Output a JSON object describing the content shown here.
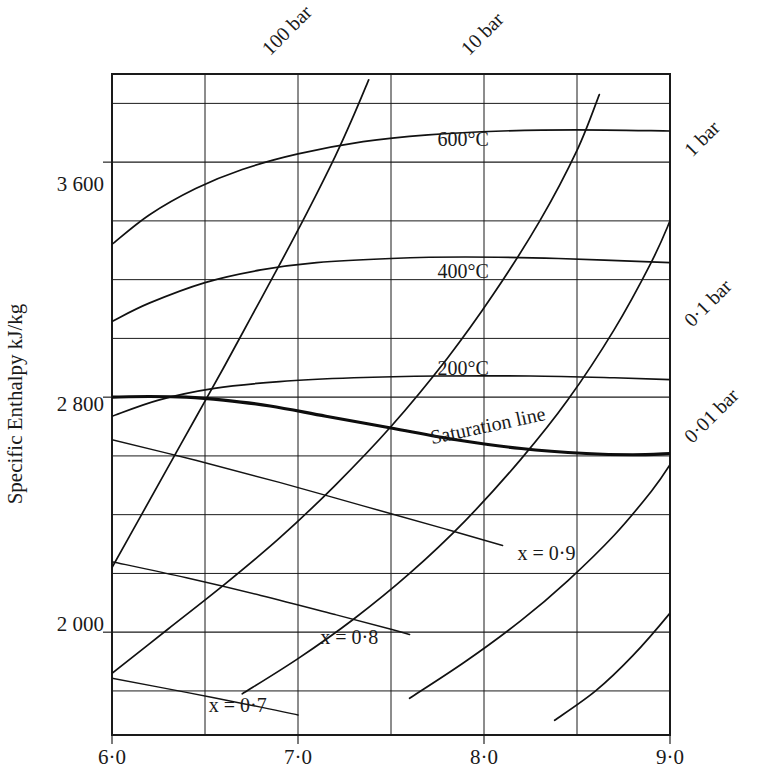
{
  "figure": {
    "kind": "mollier-enthalpy-entropy-diagram",
    "ylabel": "Specific Enthalpy kJ/kg"
  },
  "chart_data": {
    "type": "line",
    "title": "",
    "subtitle": "",
    "xlabel": "",
    "ylabel": "Specific Enthalpy kJ/kg",
    "xlim": [
      6.0,
      9.0
    ],
    "ylim": [
      1650,
      3900
    ],
    "grid": true,
    "legend_position": "inline-curve-labels",
    "x_tick_labels": [
      "6·0",
      "7·0",
      "8·0",
      "9·0"
    ],
    "x_tick_values": [
      6.0,
      7.0,
      8.0,
      9.0
    ],
    "x_minor_gridlines": [
      6.5,
      7.5,
      8.5
    ],
    "y_tick_labels": [
      "3 600",
      "2 800",
      "2 000"
    ],
    "y_tick_values": [
      3600,
      2800,
      2000
    ],
    "y_gridlines": [
      3800,
      3600,
      3400,
      3200,
      3000,
      2800,
      2600,
      2400,
      2200,
      2000,
      1800
    ],
    "series": [
      {
        "name": "600°C isotherm",
        "label": "600°C",
        "label_x": 7.75,
        "label_y": 3655,
        "style": "isotherm",
        "points": [
          [
            6.0,
            3320
          ],
          [
            6.2,
            3420
          ],
          [
            6.45,
            3510
          ],
          [
            6.7,
            3575
          ],
          [
            7.0,
            3628
          ],
          [
            7.35,
            3670
          ],
          [
            7.7,
            3693
          ],
          [
            8.1,
            3706
          ],
          [
            8.5,
            3710
          ],
          [
            9.0,
            3706
          ]
        ]
      },
      {
        "name": "400°C isotherm",
        "label": "400°C",
        "label_x": 7.75,
        "label_y": 3205,
        "style": "isotherm",
        "points": [
          [
            6.0,
            3058
          ],
          [
            6.2,
            3120
          ],
          [
            6.5,
            3190
          ],
          [
            6.8,
            3233
          ],
          [
            7.1,
            3258
          ],
          [
            7.5,
            3272
          ],
          [
            7.9,
            3277
          ],
          [
            8.4,
            3272
          ],
          [
            9.0,
            3258
          ]
        ]
      },
      {
        "name": "200°C isotherm",
        "label": "200°C",
        "label_x": 7.75,
        "label_y": 2875,
        "style": "isotherm",
        "points": [
          [
            6.0,
            2735
          ],
          [
            6.25,
            2790
          ],
          [
            6.55,
            2830
          ],
          [
            6.9,
            2853
          ],
          [
            7.3,
            2866
          ],
          [
            7.75,
            2872
          ],
          [
            8.25,
            2872
          ],
          [
            8.7,
            2866
          ],
          [
            9.0,
            2860
          ]
        ]
      },
      {
        "name": "100 bar isobar",
        "label": "100 bar",
        "label_x": 6.85,
        "label_y": 3960,
        "style": "isobar",
        "points": [
          [
            6.0,
            2220
          ],
          [
            6.15,
            2390
          ],
          [
            6.3,
            2560
          ],
          [
            6.45,
            2730
          ],
          [
            6.6,
            2900
          ],
          [
            6.75,
            3075
          ],
          [
            6.9,
            3250
          ],
          [
            7.05,
            3430
          ],
          [
            7.2,
            3620
          ],
          [
            7.3,
            3760
          ],
          [
            7.38,
            3880
          ]
        ]
      },
      {
        "name": "10 bar isobar",
        "label": "10 bar",
        "label_x": 7.92,
        "label_y": 3960,
        "style": "isobar",
        "points": [
          [
            6.0,
            1860
          ],
          [
            6.3,
            2010
          ],
          [
            6.6,
            2160
          ],
          [
            6.9,
            2320
          ],
          [
            7.2,
            2500
          ],
          [
            7.5,
            2700
          ],
          [
            7.8,
            2930
          ],
          [
            8.05,
            3150
          ],
          [
            8.3,
            3400
          ],
          [
            8.5,
            3640
          ],
          [
            8.62,
            3830
          ]
        ]
      },
      {
        "name": "1 bar isobar",
        "label": "1 bar",
        "label_x": 9.12,
        "label_y": 3615,
        "style": "isobar",
        "points": [
          [
            6.7,
            1790
          ],
          [
            7.0,
            1910
          ],
          [
            7.3,
            2045
          ],
          [
            7.6,
            2200
          ],
          [
            7.9,
            2380
          ],
          [
            8.2,
            2590
          ],
          [
            8.45,
            2790
          ],
          [
            8.7,
            3030
          ],
          [
            8.9,
            3260
          ],
          [
            9.0,
            3400
          ],
          [
            9.06,
            3500
          ]
        ]
      },
      {
        "name": "0.1 bar isobar",
        "label": "0·1 bar",
        "label_x": 9.12,
        "label_y": 3035,
        "style": "isobar",
        "points": [
          [
            7.6,
            1775
          ],
          [
            7.9,
            1900
          ],
          [
            8.2,
            2040
          ],
          [
            8.45,
            2175
          ],
          [
            8.7,
            2330
          ],
          [
            8.9,
            2480
          ],
          [
            9.0,
            2570
          ],
          [
            9.08,
            2660
          ]
        ]
      },
      {
        "name": "0.01 bar isobar",
        "label": "0·01 bar",
        "label_x": 9.12,
        "label_y": 2640,
        "style": "isobar",
        "points": [
          [
            8.38,
            1700
          ],
          [
            8.6,
            1800
          ],
          [
            8.8,
            1920
          ],
          [
            9.0,
            2065
          ],
          [
            9.08,
            2135
          ]
        ]
      },
      {
        "name": "Saturation line",
        "label": "Saturation line",
        "label_x": 7.72,
        "label_y": 2640,
        "style": "saturation",
        "points": [
          [
            6.0,
            2800
          ],
          [
            6.2,
            2802
          ],
          [
            6.4,
            2800
          ],
          [
            6.6,
            2790
          ],
          [
            6.85,
            2770
          ],
          [
            7.15,
            2735
          ],
          [
            7.5,
            2695
          ],
          [
            7.85,
            2655
          ],
          [
            8.2,
            2625
          ],
          [
            8.55,
            2608
          ],
          [
            8.8,
            2604
          ],
          [
            9.0,
            2608
          ]
        ]
      },
      {
        "name": "x = 0.9 quality line",
        "label": "x = 0·9",
        "label_x": 8.18,
        "label_y": 2245,
        "style": "quality",
        "points": [
          [
            6.0,
            2655
          ],
          [
            6.45,
            2585
          ],
          [
            6.9,
            2510
          ],
          [
            7.35,
            2430
          ],
          [
            7.8,
            2350
          ],
          [
            8.1,
            2295
          ]
        ]
      },
      {
        "name": "x = 0.8 quality line",
        "label": "x = 0·8",
        "label_x": 7.12,
        "label_y": 1960,
        "style": "quality",
        "points": [
          [
            6.0,
            2240
          ],
          [
            6.4,
            2185
          ],
          [
            6.8,
            2125
          ],
          [
            7.2,
            2060
          ],
          [
            7.5,
            2010
          ],
          [
            7.6,
            1992
          ]
        ]
      },
      {
        "name": "x = 0.7 quality line",
        "label": "x = 0·7",
        "label_x": 6.52,
        "label_y": 1730,
        "style": "quality",
        "points": [
          [
            6.0,
            1843
          ],
          [
            6.4,
            1795
          ],
          [
            6.8,
            1745
          ],
          [
            7.0,
            1718
          ]
        ]
      }
    ],
    "annotations": [
      {
        "text": "600°C",
        "x": 7.75,
        "y": 3655
      },
      {
        "text": "400°C",
        "x": 7.75,
        "y": 3205
      },
      {
        "text": "200°C",
        "x": 7.75,
        "y": 2875
      },
      {
        "text": "100 bar",
        "x": 6.85,
        "y": 3960,
        "rotation": -45
      },
      {
        "text": "10 bar",
        "x": 7.92,
        "y": 3960,
        "rotation": -45
      },
      {
        "text": "1 bar",
        "x": 9.12,
        "y": 3615,
        "rotation": -45
      },
      {
        "text": "0·1 bar",
        "x": 9.12,
        "y": 3035,
        "rotation": -45
      },
      {
        "text": "0·01 bar",
        "x": 9.12,
        "y": 2640,
        "rotation": -45
      },
      {
        "text": "Saturation line",
        "x": 7.72,
        "y": 2640,
        "rotation": -12
      },
      {
        "text": "x = 0·9",
        "x": 8.18,
        "y": 2245
      },
      {
        "text": "x = 0·8",
        "x": 7.12,
        "y": 1960
      },
      {
        "text": "x = 0·7",
        "x": 6.52,
        "y": 1730
      }
    ]
  },
  "labels": {
    "y_axis_title": "Specific Enthalpy kJ/kg",
    "y_tick_3600": "3 600",
    "y_tick_2800": "2 800",
    "y_tick_2000": "2 000",
    "x_tick_60": "6·0",
    "x_tick_70": "7·0",
    "x_tick_80": "8·0",
    "x_tick_90": "9·0",
    "iso_600": "600°C",
    "iso_400": "400°C",
    "iso_200": "200°C",
    "p_100bar": "100 bar",
    "p_10bar": "10 bar",
    "p_1bar": "1 bar",
    "p_01bar": "0·1 bar",
    "p_001bar": "0·01 bar",
    "saturation": "Saturation line",
    "x_09": "x = 0·9",
    "x_08": "x = 0·8",
    "x_07": "x = 0·7"
  },
  "colors": {
    "ink": "#1a1a1a",
    "background": "#ffffff",
    "curve": "#111111"
  }
}
